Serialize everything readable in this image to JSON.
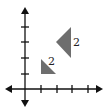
{
  "diagram": {
    "type": "coordinate-plane-triangles",
    "axes": {
      "origin_px": [
        25,
        89
      ],
      "unit_px": 15.5,
      "x_ticks": [
        1,
        2,
        3,
        4
      ],
      "y_ticks": [
        1,
        2,
        3,
        4
      ],
      "color": "#111111"
    },
    "shapes": [
      {
        "name": "small-triangle",
        "vertices": [
          [
            1,
            2
          ],
          [
            1,
            1
          ],
          [
            2,
            1
          ]
        ],
        "fill": "#6e6e6e",
        "label": "2"
      },
      {
        "name": "large-triangle",
        "vertices": [
          [
            3,
            4
          ],
          [
            3,
            2
          ],
          [
            2,
            3
          ]
        ],
        "fill": "#6e6e6e",
        "label": "2"
      }
    ]
  }
}
